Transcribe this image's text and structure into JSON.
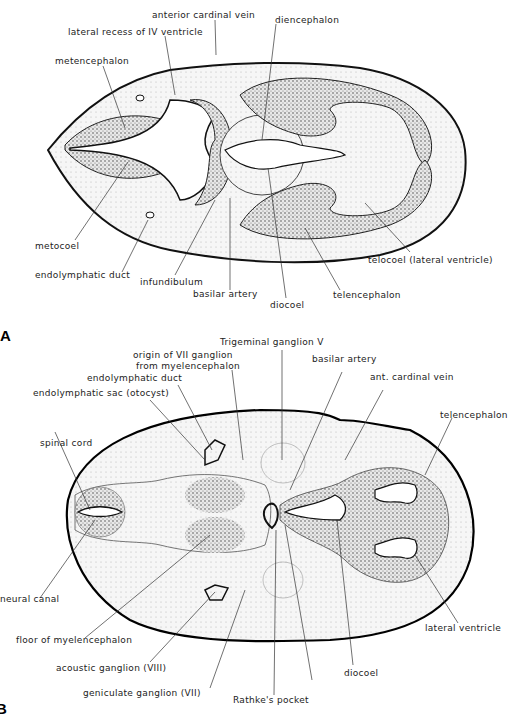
{
  "figure": {
    "panels": [
      {
        "id": "A",
        "labels": {
          "anterior_cardinal_vein": "anterior cardinal vein",
          "lateral_recess": "lateral recess of IV ventricle",
          "diencephalon": "diencephalon",
          "metencephalon": "metencephalon",
          "metocoel": "metocoel",
          "endolymphatic_duct": "endolymphatic duct",
          "infundibulum": "infundibulum",
          "basilar_artery": "basilar artery",
          "diocoel": "diocoel",
          "telencephalon": "telencephalon",
          "telocoel": "telocoel (lateral ventricle)"
        }
      },
      {
        "id": "B",
        "labels": {
          "trigeminal_ganglion": "Trigeminal ganglion V",
          "origin_vii_1": "origin of VII ganglion",
          "origin_vii_2": "from myelencephalon",
          "endolymphatic_duct": "endolymphatic duct",
          "endolymphatic_sac": "endolymphatic sac (otocyst)",
          "basilar_artery": "basilar artery",
          "ant_cardinal_vein": "ant. cardinal vein",
          "telencephalon": "telencephalon",
          "spinal_cord": "spinal cord",
          "neural_canal": "neural canal",
          "floor_myelencephalon": "floor of myelencephalon",
          "acoustic_ganglion": "acoustic ganglion (VIII)",
          "geniculate_ganglion": "geniculate ganglion (VII)",
          "rathkes_pocket": "Rathke's pocket",
          "diocoel": "diocoel",
          "lateral_ventricle": "lateral ventricle"
        }
      }
    ]
  }
}
